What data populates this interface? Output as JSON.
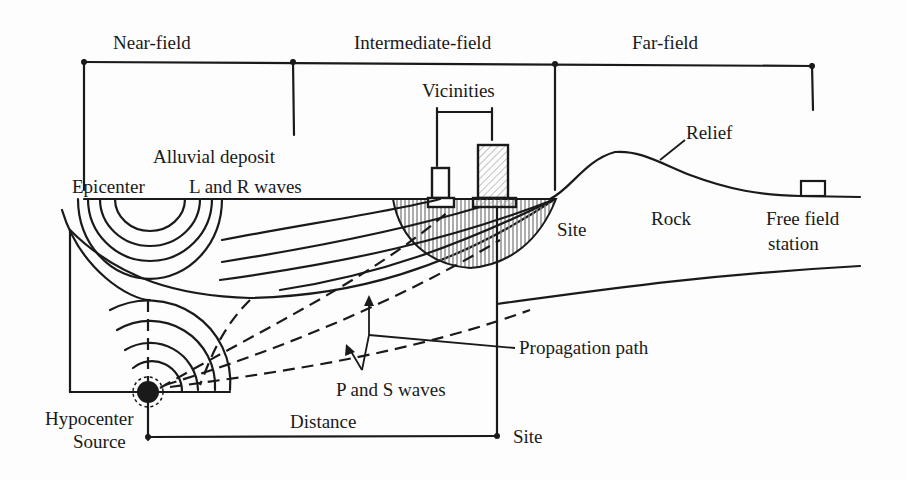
{
  "diagram": {
    "zones": {
      "near_field": "Near-field",
      "intermediate_field": "Intermediate-field",
      "far_field": "Far-field"
    },
    "labels": {
      "vicinities": "Vicinities",
      "relief": "Relief",
      "alluvial_deposit": "Alluvial deposit",
      "epicenter": "Epicenter",
      "l_and_r_waves": "L and R waves",
      "site_right": "Site",
      "rock": "Rock",
      "free_field_line1": "Free field",
      "free_field_line2": "station",
      "propagation_path": "Propagation path",
      "p_and_s_waves": "P and S waves",
      "hypocenter": "Hypocenter",
      "source": "Source",
      "distance": "Distance",
      "site_bottom": "Site"
    },
    "colors": {
      "ink": "#1a1a1a",
      "background": "#fdfdfd",
      "hatch": "#9a9a9a"
    }
  }
}
